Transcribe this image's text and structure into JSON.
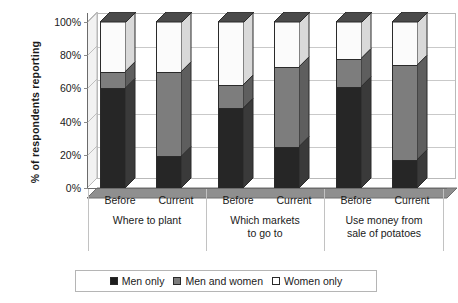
{
  "chart_data": {
    "type": "bar",
    "subtype": "stacked-column-3d",
    "title": "",
    "xlabel": "",
    "ylabel": "% of respondents reporting",
    "ylim": [
      0,
      100
    ],
    "ytick_labels": [
      "0%",
      "20%",
      "40%",
      "60%",
      "80%",
      "100%"
    ],
    "ytick_values": [
      0,
      20,
      40,
      60,
      80,
      100
    ],
    "grid": true,
    "grid_axis": "y",
    "legend_position": "bottom",
    "categories": [
      "Before",
      "Current",
      "Before",
      "Current",
      "Before",
      "Current"
    ],
    "groups": [
      {
        "label": "Where to plant",
        "label_lines": [
          "Where to plant"
        ],
        "categories": [
          "Before",
          "Current"
        ]
      },
      {
        "label": "Which markets to go to",
        "label_lines": [
          "Which markets",
          "to go to"
        ],
        "categories": [
          "Before",
          "Current"
        ]
      },
      {
        "label": "Use money from sale of potatoes",
        "label_lines": [
          "Use money from",
          "sale of potatoes"
        ],
        "categories": [
          "Before",
          "Current"
        ]
      }
    ],
    "series": [
      {
        "name": "Men only",
        "color": "#262626",
        "values": [
          60,
          19,
          48,
          25,
          61,
          17
        ]
      },
      {
        "name": "Men and women",
        "color": "#7d7d7d",
        "values": [
          10,
          51,
          14,
          48,
          17,
          57
        ]
      },
      {
        "name": "Women only",
        "color": "#ffffff",
        "values": [
          30,
          30,
          38,
          27,
          22,
          26
        ]
      }
    ],
    "bars": [
      {
        "group": "Where to plant",
        "category": "Before",
        "men_only": 60,
        "men_and_women": 10,
        "women_only": 30
      },
      {
        "group": "Where to plant",
        "category": "Current",
        "men_only": 19,
        "men_and_women": 51,
        "women_only": 30
      },
      {
        "group": "Which markets to go to",
        "category": "Before",
        "men_only": 48,
        "men_and_women": 14,
        "women_only": 38
      },
      {
        "group": "Which markets to go to",
        "category": "Current",
        "men_only": 25,
        "men_and_women": 48,
        "women_only": 27
      },
      {
        "group": "Use money from sale of potatoes",
        "category": "Before",
        "men_only": 61,
        "men_and_women": 17,
        "women_only": 22
      },
      {
        "group": "Use money from sale of potatoes",
        "category": "Current",
        "men_only": 17,
        "men_and_women": 57,
        "women_only": 26
      }
    ]
  },
  "legend": {
    "items": [
      {
        "label": "Men only",
        "swatch": "black"
      },
      {
        "label": "Men and women",
        "swatch": "gray"
      },
      {
        "label": "Women only",
        "swatch": "white"
      }
    ]
  },
  "colors": {
    "men_only": "#262626",
    "men_and_women": "#7d7d7d",
    "women_only": "#ffffff",
    "floor": "#8f8f8f",
    "sidewall": "#f2f2f2",
    "grid": "#c9c9c9",
    "axis": "#6b6b6b",
    "text": "#1a1a1a"
  }
}
